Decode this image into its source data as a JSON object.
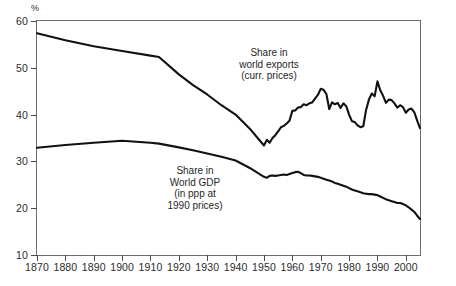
{
  "chart_data": {
    "type": "line",
    "title": "",
    "xlabel": "",
    "ylabel": "%",
    "ylim": [
      10,
      60
    ],
    "xlim": [
      1870,
      2005
    ],
    "yticks": [
      60,
      50,
      40,
      30,
      20,
      10
    ],
    "xticks": [
      1870,
      1880,
      1890,
      1900,
      1910,
      1920,
      1930,
      1940,
      1950,
      1960,
      1970,
      1980,
      1990,
      2000
    ],
    "grid": false,
    "legend_position": "inline-annotations",
    "annotations": [
      {
        "name": "exports-annotation",
        "lines": [
          "Share in",
          "world exports",
          "(curr. prices)"
        ]
      },
      {
        "name": "gdp-annotation",
        "lines": [
          "Share in",
          "World GDP",
          "(in ppp at",
          "1990 prices)"
        ]
      }
    ],
    "series": [
      {
        "name": "Share in world exports (curr. prices)",
        "color": "#111111",
        "x": [
          1870,
          1880,
          1890,
          1900,
          1910,
          1913,
          1920,
          1925,
          1930,
          1935,
          1940,
          1945,
          1950,
          1951,
          1952,
          1953,
          1954,
          1955,
          1956,
          1957,
          1958,
          1959,
          1960,
          1961,
          1962,
          1963,
          1964,
          1965,
          1966,
          1967,
          1968,
          1969,
          1970,
          1971,
          1972,
          1973,
          1974,
          1975,
          1976,
          1977,
          1978,
          1979,
          1980,
          1981,
          1982,
          1983,
          1984,
          1985,
          1986,
          1987,
          1988,
          1989,
          1990,
          1991,
          1992,
          1993,
          1994,
          1995,
          1996,
          1997,
          1998,
          1999,
          2000,
          2001,
          2002,
          2003,
          2004,
          2005
        ],
        "values": [
          57.4,
          55.9,
          54.6,
          53.6,
          52.6,
          52.3,
          48.6,
          46.3,
          44.3,
          42.0,
          40.0,
          37.0,
          33.4,
          34.6,
          34.0,
          35.0,
          35.6,
          36.4,
          37.3,
          37.6,
          38.1,
          38.7,
          40.8,
          40.9,
          41.5,
          41.6,
          42.2,
          42.0,
          42.4,
          42.6,
          43.4,
          44.2,
          45.5,
          45.3,
          44.4,
          41.2,
          42.6,
          42.2,
          42.5,
          41.4,
          42.4,
          41.8,
          40.0,
          38.6,
          38.4,
          37.7,
          37.3,
          37.5,
          41.0,
          43.2,
          44.5,
          43.9,
          47.1,
          45.2,
          44.0,
          42.5,
          43.2,
          43.1,
          42.4,
          41.5,
          42.0,
          41.6,
          40.4,
          41.1,
          41.3,
          40.5,
          38.7,
          37.1
        ]
      },
      {
        "name": "Share in World GDP (in ppp at 1990 prices)",
        "color": "#111111",
        "x": [
          1870,
          1880,
          1890,
          1900,
          1910,
          1913,
          1920,
          1925,
          1930,
          1935,
          1940,
          1945,
          1950,
          1951,
          1952,
          1953,
          1954,
          1955,
          1956,
          1957,
          1958,
          1959,
          1960,
          1961,
          1962,
          1963,
          1964,
          1965,
          1966,
          1967,
          1968,
          1969,
          1970,
          1971,
          1972,
          1973,
          1974,
          1975,
          1976,
          1977,
          1978,
          1979,
          1980,
          1981,
          1982,
          1983,
          1984,
          1985,
          1986,
          1987,
          1988,
          1989,
          1990,
          1991,
          1992,
          1993,
          1994,
          1995,
          1996,
          1997,
          1998,
          1999,
          2000,
          2001,
          2002,
          2003,
          2004,
          2005
        ],
        "values": [
          32.9,
          33.5,
          34.0,
          34.4,
          34.0,
          33.8,
          33.0,
          32.4,
          31.7,
          31.0,
          30.2,
          28.6,
          26.7,
          26.5,
          26.9,
          27.0,
          26.9,
          27.0,
          27.1,
          27.2,
          27.1,
          27.3,
          27.5,
          27.7,
          27.8,
          27.5,
          27.1,
          27.0,
          27.0,
          26.9,
          26.8,
          26.7,
          26.5,
          26.3,
          26.1,
          25.9,
          25.7,
          25.4,
          25.2,
          25.0,
          24.8,
          24.6,
          24.3,
          24.0,
          23.8,
          23.6,
          23.4,
          23.2,
          23.1,
          23.0,
          23.0,
          22.9,
          22.8,
          22.5,
          22.2,
          21.9,
          21.7,
          21.5,
          21.3,
          21.1,
          21.1,
          20.9,
          20.6,
          20.2,
          19.7,
          19.2,
          18.4,
          17.7
        ]
      }
    ]
  },
  "axis": {
    "unit_label": "%"
  }
}
